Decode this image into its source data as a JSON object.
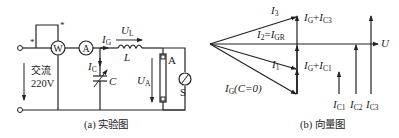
{
  "figure_a": {
    "caption": "(a) 实验图",
    "source_label_line1": "交流",
    "source_label_line2": "220V",
    "wattmeter": "W",
    "ammeter": "A",
    "star1": "*",
    "star2": "*",
    "current_IG": {
      "main": "I",
      "sub": "G"
    },
    "current_IC": {
      "main": "I",
      "sub": "C"
    },
    "voltage_UL": {
      "main": "U",
      "sub": "L"
    },
    "inductor": "L",
    "capacitor": "C",
    "voltage_UA": {
      "main": "U",
      "sub": "A"
    },
    "lamp": "A",
    "switch": "S"
  },
  "figure_b": {
    "caption": "(b) 向量图",
    "I3": {
      "main": "I",
      "sub": "3"
    },
    "I2": {
      "main": "I",
      "sub": "2",
      "eq": "=",
      "main2": "I",
      "sub2": "GR"
    },
    "I1": {
      "main": "I",
      "sub": "1"
    },
    "IG0": {
      "main": "I",
      "sub": "G",
      "rest": "(C=0)"
    },
    "IG_IC3": {
      "a": "I",
      "asub": "G",
      "plus": "+",
      "b": "I",
      "bsub": "C3"
    },
    "IG_IC1": {
      "a": "I",
      "asub": "G",
      "plus": "+",
      "b": "I",
      "bsub": "C1"
    },
    "U": "U",
    "IC1": {
      "main": "I",
      "sub": "C1"
    },
    "IC2": {
      "main": "I",
      "sub": "C2"
    },
    "IC3": {
      "main": "I",
      "sub": "C3"
    }
  },
  "colors": {
    "ink": "#222222",
    "background": "#ffffff"
  }
}
